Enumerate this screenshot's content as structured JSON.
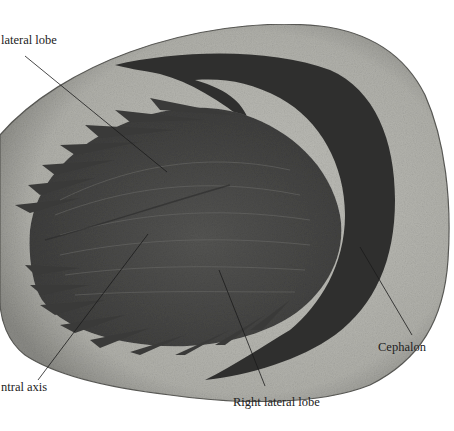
{
  "figure": {
    "labels": [
      {
        "id": "left-lateral-lobe",
        "text": "lateral lobe",
        "x": 1,
        "y": 33,
        "line": [
          25,
          56,
          167,
          172
        ]
      },
      {
        "id": "central-axis",
        "text": "ntral axis",
        "x": 1,
        "y": 380,
        "line": [
          38,
          380,
          148,
          234
        ]
      },
      {
        "id": "right-lateral-lobe",
        "text": "Right lateral lobe",
        "x": 233,
        "y": 395,
        "line": [
          219,
          270,
          265,
          386
        ]
      },
      {
        "id": "cephalon",
        "text": "Cephalon",
        "x": 378,
        "y": 340,
        "line": [
          360,
          247,
          412,
          335
        ]
      }
    ]
  },
  "colors": {
    "background": "#ffffff",
    "matrix_rock": "#b3b3ad",
    "matrix_rock_dark": "#8e8e88",
    "fossil_body": "#4a4a48",
    "fossil_dark": "#2e2e2d",
    "callout_line": "#1a1a1a",
    "label_text": "#222222"
  }
}
